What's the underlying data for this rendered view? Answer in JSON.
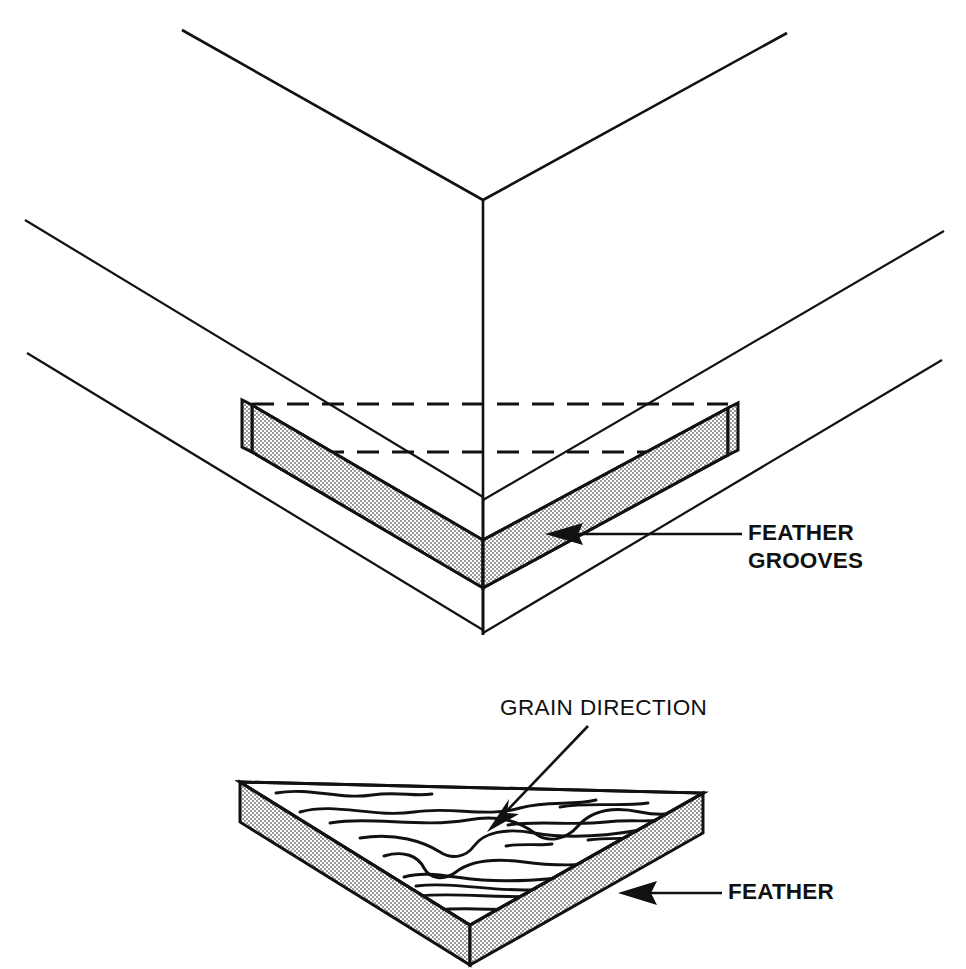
{
  "figure": {
    "title_fragment": "",
    "background_color": "#ffffff",
    "ink_color": "#111111",
    "stipple_fill_color": "#d8d8d8",
    "width": 966,
    "height": 969
  },
  "callouts": [
    {
      "id": "feather-grooves",
      "lines": [
        "FEATHER",
        "GROOVES"
      ],
      "line1": "FEATHER",
      "line2": "GROOVES",
      "weight": "bold",
      "text_x": 748,
      "text_y_line1": 534,
      "text_y_line2": 562,
      "leader_start_x": 742,
      "leader_start_y": 534,
      "leader_end_x": 545,
      "leader_end_y": 534,
      "arrow_direction": "left",
      "points_to": "upper-feather-strip"
    },
    {
      "id": "grain-direction",
      "lines": [
        "GRAIN DIRECTION"
      ],
      "line1": "GRAIN DIRECTION",
      "weight": "regular",
      "text_x": 500,
      "text_y_line1": 709,
      "leader_start_x": 588,
      "leader_start_y": 726,
      "leader_end_x": 487,
      "leader_end_y": 832,
      "arrow_direction": "down-left",
      "points_to": "grain-squiggles"
    },
    {
      "id": "feather",
      "lines": [
        "FEATHER"
      ],
      "line1": "FEATHER",
      "weight": "bold",
      "text_x": 728,
      "text_y_line1": 893,
      "leader_start_x": 722,
      "leader_start_y": 893,
      "leader_end_x": 618,
      "leader_end_y": 893,
      "arrow_direction": "left",
      "points_to": "lower-feather-plate"
    }
  ],
  "upper_diagram": {
    "name": "mitered-corner-with-feather-grooves",
    "description": "Isometric outside corner of a mitered frame showing a V-shaped feather spline seated in grooves, drawn with hidden (dashed) groove lines.",
    "corner_apex": {
      "x": 483,
      "y": 200
    },
    "vertical_edge": {
      "x": 483,
      "y_top": 200,
      "y_bottom": 635
    },
    "top_edge_left_end": {
      "x": 182,
      "y": 30
    },
    "top_edge_right_end": {
      "x": 787,
      "y": 33
    },
    "mid_edge_left_end": {
      "x": 25,
      "y": 220
    },
    "mid_edge_right_end": {
      "x": 944,
      "y": 231
    },
    "bottom_edge_left_end": {
      "x": 27,
      "y": 353
    },
    "bottom_edge_right_end": {
      "x": 942,
      "y": 360
    },
    "hidden_groove_lines": [
      {
        "y": 404,
        "x_start": 252,
        "x_end": 728
      },
      {
        "y": 452,
        "x_start": 252,
        "x_end": 728
      }
    ],
    "feather_apex_top": {
      "x": 483,
      "y": 540
    },
    "feather_apex_bottom": {
      "x": 483,
      "y": 588
    },
    "feather_left_end_top": {
      "x": 252,
      "y": 405
    },
    "feather_left_end_bottom": {
      "x": 252,
      "y": 452
    },
    "feather_right_end_top": {
      "x": 728,
      "y": 408
    },
    "feather_right_end_bottom": {
      "x": 728,
      "y": 455
    }
  },
  "lower_diagram": {
    "name": "feather-blank-with-grain",
    "description": "Isometric triangular feather (spline) blank lying flat, top face showing wood grain squiggles running across the triangle, stippled edge faces.",
    "top_face_vertices": [
      {
        "x": 240,
        "y": 782
      },
      {
        "x": 703,
        "y": 793
      },
      {
        "x": 470,
        "y": 925
      }
    ],
    "thickness_px": 40,
    "bottom_apex": {
      "x": 470,
      "y": 965
    },
    "left_edge_bottom": {
      "x": 240,
      "y": 822
    },
    "right_edge_bottom": {
      "x": 703,
      "y": 833
    },
    "grain_line_count": 11
  },
  "legend": {
    "stipple_meaning": "sectioned / edge face of feather stock",
    "dashed_meaning": "hidden groove outline"
  }
}
